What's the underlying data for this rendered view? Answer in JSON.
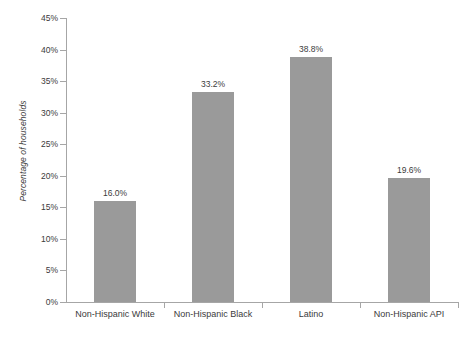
{
  "chart_data": {
    "type": "bar",
    "title": "",
    "subtitle": "",
    "xlabel": "",
    "ylabel": "Percentage of households",
    "categories": [
      "Non-Hispanic White",
      "Non-Hispanic Black",
      "Latino",
      "Non-Hispanic API"
    ],
    "values": [
      16.0,
      33.2,
      38.8,
      19.6
    ],
    "value_labels": [
      "16.0%",
      "33.2%",
      "38.8%",
      "19.6%"
    ],
    "ylim": [
      0,
      45
    ],
    "ytick_values": [
      0,
      5,
      10,
      15,
      20,
      25,
      30,
      35,
      40,
      45
    ],
    "ytick_labels": [
      "0%",
      "5%",
      "10%",
      "15%",
      "20%",
      "25%",
      "30%",
      "35%",
      "40%",
      "45%"
    ],
    "grid": false,
    "legend": null,
    "legend_position": "none",
    "series": [
      {
        "name": "Percentage of households",
        "values": [
          16.0,
          33.2,
          38.8,
          19.6
        ]
      }
    ],
    "colors": {
      "bar_fill": "#9a9a9a",
      "axis_line": "#a6a6a6",
      "text": "#3b3b3b",
      "background": "#ffffff"
    }
  }
}
